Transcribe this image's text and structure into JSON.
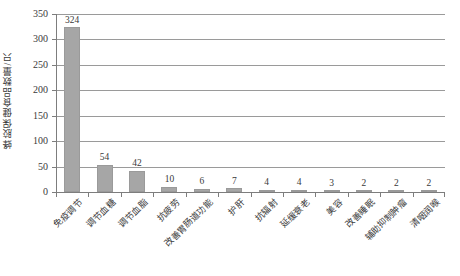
{
  "chart_data": {
    "type": "bar",
    "title": "",
    "subtitle": "",
    "xlabel": "",
    "ylabel": "蜂胶保健食品数量/只",
    "ylim": [
      0,
      350
    ],
    "ytick_step": 50,
    "yticks": [
      "0",
      "50",
      "100",
      "150",
      "200",
      "250",
      "300",
      "350"
    ],
    "grid": "horizontal",
    "legend": "none",
    "bar_color": "#a6a6a6",
    "axis_color": "#7d7d7d",
    "gridline_color": "#9a9a9a",
    "label_rotation_deg": -45,
    "categories": [
      "免疫调节",
      "调节血糖",
      "调节血脂",
      "抗疲劳",
      "改善胃肠道功能",
      "护肝",
      "抗辐射",
      "延缓衰老",
      "美容",
      "改善睡眠",
      "辅助抑制肿瘤",
      "清咽润喉"
    ],
    "values": [
      324,
      54,
      42,
      10,
      6,
      7,
      4,
      4,
      3,
      2,
      2,
      2
    ],
    "value_labels": [
      "324",
      "54",
      "42",
      "10",
      "6",
      "7",
      "4",
      "4",
      "3",
      "2",
      "2",
      "2"
    ]
  }
}
